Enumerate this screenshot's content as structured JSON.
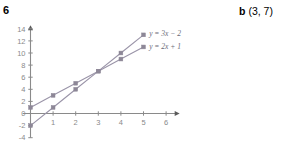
{
  "question": {
    "number": "6"
  },
  "answer": {
    "label": "b",
    "value": "(3, 7)"
  },
  "chart_data": {
    "type": "line",
    "title": "",
    "xlabel": "",
    "ylabel": "",
    "xlim": [
      -0.35,
      6.6
    ],
    "ylim": [
      -4,
      14.6
    ],
    "xticks": [
      1,
      2,
      3,
      4,
      5,
      6
    ],
    "xtick_labels": [
      "1",
      "2",
      "3",
      "4",
      "5",
      "6"
    ],
    "yticks": [
      -4,
      -2,
      0,
      2,
      4,
      6,
      8,
      10,
      12,
      14
    ],
    "ytick_labels": [
      "-4",
      "-2",
      "0",
      "2",
      "4",
      "6",
      "8",
      "10",
      "12",
      "14"
    ],
    "grid": false,
    "legend_position": "right-of-line-ends",
    "axis_color": "#8a8a8a",
    "line_color": "#9a94a8",
    "marker_color": "#8d8797",
    "series": [
      {
        "name": "y = 3x − 2",
        "label": "y = 3x − 2",
        "equation": "y = 3x - 2",
        "slope": 3,
        "intercept": -2,
        "x": [
          0,
          1,
          2,
          3,
          4,
          5
        ],
        "values": [
          -2,
          1,
          4,
          7,
          10,
          13
        ],
        "label_x": 5.25,
        "label_y": 13.2
      },
      {
        "name": "y = 2x + 1",
        "label": "y = 2x + 1",
        "equation": "y = 2x + 1",
        "slope": 2,
        "intercept": 1,
        "x": [
          0,
          1,
          2,
          3,
          4,
          5
        ],
        "values": [
          1,
          3,
          5,
          7,
          9,
          11
        ],
        "label_x": 5.25,
        "label_y": 11.1
      }
    ],
    "annotations": [
      {
        "name": "intersection",
        "x": 3,
        "y": 7,
        "text": ""
      }
    ]
  }
}
